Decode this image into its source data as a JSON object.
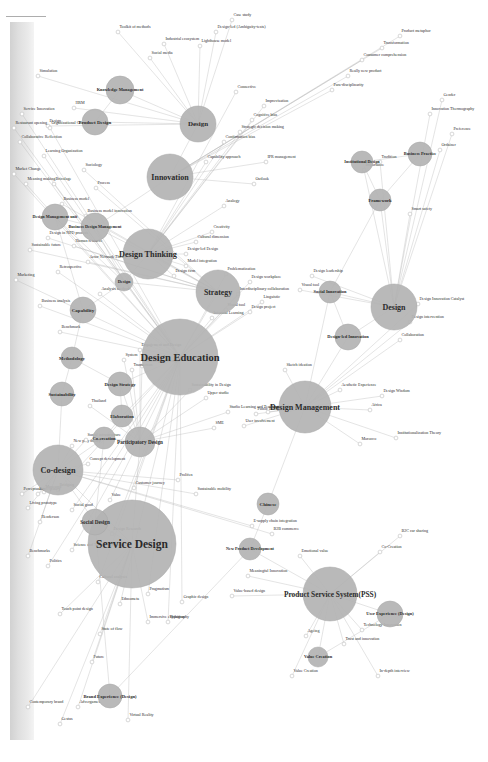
{
  "figure": {
    "kind": "node-link-network",
    "orientation_deg": -90,
    "background_color": "#ffffff",
    "node_fill": "#b3b3b3",
    "leaf_fill": "#ffffff",
    "edge_color": "#b9b9b9",
    "label_color": "#2b2b2b"
  },
  "chart_data": {
    "type": "network",
    "title": "",
    "hubs": [
      {
        "label": "Service Design",
        "x": 218,
        "y": 132,
        "r": 44,
        "fs": 11.5
      },
      {
        "label": "Design Education",
        "x": 405,
        "y": 180,
        "r": 38,
        "fs": 10.5
      },
      {
        "label": "Co-design",
        "x": 292,
        "y": 58,
        "r": 25,
        "fs": 8.2
      },
      {
        "label": "Design Management",
        "x": 355,
        "y": 305,
        "r": 26,
        "fs": 8.0
      },
      {
        "label": "Product Service System(PSS)",
        "x": 168,
        "y": 330,
        "r": 27,
        "fs": 7.4
      },
      {
        "label": "Design Thinking",
        "x": 508,
        "y": 148,
        "r": 25,
        "fs": 8.2
      },
      {
        "label": "Strategy",
        "x": 470,
        "y": 218,
        "r": 22,
        "fs": 7.8
      },
      {
        "label": "Innovation",
        "x": 585,
        "y": 170,
        "r": 23,
        "fs": 8.0
      },
      {
        "label": "Design",
        "x": 455,
        "y": 394,
        "r": 23,
        "fs": 8.0
      },
      {
        "label": "Design",
        "x": 638,
        "y": 198,
        "r": 18,
        "fs": 7.0
      },
      {
        "label": "Brand Experience (Design)",
        "x": 66,
        "y": 110,
        "r": 12,
        "fs": 4.6
      },
      {
        "label": "Social Design",
        "x": 240,
        "y": 95,
        "r": 13,
        "fs": 5.2
      },
      {
        "label": "New Product Development",
        "x": 213,
        "y": 250,
        "r": 11,
        "fs": 4.2
      },
      {
        "label": "Participatory Design",
        "x": 320,
        "y": 140,
        "r": 15,
        "fs": 5.2
      },
      {
        "label": "Chinese",
        "x": 258,
        "y": 268,
        "r": 11,
        "fs": 5.0
      },
      {
        "label": "User Experience (Design)",
        "x": 148,
        "y": 390,
        "r": 13,
        "fs": 4.4
      },
      {
        "label": "Value Creation",
        "x": 105,
        "y": 318,
        "r": 10,
        "fs": 4.4
      },
      {
        "label": "Design-led Innovation",
        "x": 425,
        "y": 348,
        "r": 13,
        "fs": 4.4
      },
      {
        "label": "Social Innovation",
        "x": 470,
        "y": 330,
        "r": 11,
        "fs": 4.4
      },
      {
        "label": "Product Design",
        "x": 640,
        "y": 95,
        "r": 13,
        "fs": 5.0
      },
      {
        "label": "Knowledge Management",
        "x": 672,
        "y": 120,
        "r": 14,
        "fs": 4.4
      },
      {
        "label": "Business Design Management",
        "x": 535,
        "y": 95,
        "r": 14,
        "fs": 4.2
      },
      {
        "label": "Design Management unit",
        "x": 545,
        "y": 55,
        "r": 13,
        "fs": 4.2
      },
      {
        "label": "Co-creation",
        "x": 324,
        "y": 104,
        "r": 11,
        "fs": 4.6
      },
      {
        "label": "Elaboration",
        "x": 346,
        "y": 122,
        "r": 11,
        "fs": 4.6
      },
      {
        "label": "Design Strategy",
        "x": 378,
        "y": 120,
        "r": 12,
        "fs": 4.6
      },
      {
        "label": "Capability",
        "x": 452,
        "y": 83,
        "r": 13,
        "fs": 5.0
      },
      {
        "label": "Methodology",
        "x": 404,
        "y": 72,
        "r": 11,
        "fs": 4.6
      },
      {
        "label": "Sustainability",
        "x": 368,
        "y": 62,
        "r": 12,
        "fs": 4.6
      },
      {
        "label": "Design",
        "x": 480,
        "y": 124,
        "r": 9,
        "fs": 4.4
      },
      {
        "label": "Framework",
        "x": 562,
        "y": 380,
        "r": 11,
        "fs": 4.6
      },
      {
        "label": "Institutional Design",
        "x": 600,
        "y": 362,
        "r": 11,
        "fs": 4.2
      },
      {
        "label": "Business Practice",
        "x": 608,
        "y": 420,
        "r": 12,
        "fs": 4.4
      }
    ],
    "leaves": [
      {
        "label": "Contemporary brand",
        "x": 55,
        "y": 28,
        "from": 0
      },
      {
        "label": "Gestus",
        "x": 38,
        "y": 60,
        "from": 0
      },
      {
        "label": "Advergames",
        "x": 55,
        "y": 78,
        "from": 0
      },
      {
        "label": "Future",
        "x": 100,
        "y": 92,
        "from": 0
      },
      {
        "label": "State of flow",
        "x": 128,
        "y": 100,
        "from": 0
      },
      {
        "label": "Virtual Reality",
        "x": 42,
        "y": 128,
        "from": 0
      },
      {
        "label": "Immersive exhibition",
        "x": 140,
        "y": 148,
        "from": 0
      },
      {
        "label": "Touch point design",
        "x": 148,
        "y": 60,
        "from": 0
      },
      {
        "label": "Politics",
        "x": 196,
        "y": 48,
        "from": 1
      },
      {
        "label": "Science and Technology Studies",
        "x": 212,
        "y": 72,
        "from": 1
      },
      {
        "label": "Cultural analysis",
        "x": 180,
        "y": 98,
        "from": 1
      },
      {
        "label": "Ethnometa",
        "x": 158,
        "y": 120,
        "from": 1
      },
      {
        "label": "Pragmatism",
        "x": 168,
        "y": 148,
        "from": 1
      },
      {
        "label": "Typography",
        "x": 140,
        "y": 168,
        "from": 1
      },
      {
        "label": "Graphic design",
        "x": 160,
        "y": 182,
        "from": 1
      },
      {
        "label": "Design Research",
        "x": 228,
        "y": 112,
        "from": 1
      },
      {
        "label": "Value",
        "x": 262,
        "y": 110,
        "from": 1
      },
      {
        "label": "Customer journey",
        "x": 274,
        "y": 134,
        "from": 1
      },
      {
        "label": "Social good",
        "x": 252,
        "y": 72,
        "from": 1
      },
      {
        "label": "Bridging",
        "x": 272,
        "y": 58,
        "from": 1
      },
      {
        "label": "Henderson",
        "x": 240,
        "y": 40,
        "from": 2
      },
      {
        "label": "Living prototype",
        "x": 254,
        "y": 28,
        "from": 2
      },
      {
        "label": "Participatory",
        "x": 268,
        "y": 38,
        "from": 2
      },
      {
        "label": "E-supply chain integration",
        "x": 236,
        "y": 252,
        "from": 2
      },
      {
        "label": "B2B commerce",
        "x": 228,
        "y": 272,
        "from": 2
      },
      {
        "label": "Museums",
        "x": 270,
        "y": 44,
        "from": 2
      },
      {
        "label": "Concept development",
        "x": 298,
        "y": 88,
        "from": 2
      },
      {
        "label": "New play theory",
        "x": 316,
        "y": 72,
        "from": 2
      },
      {
        "label": "Social infrastructure",
        "x": 322,
        "y": 86,
        "from": 2
      },
      {
        "label": "Sustainable mobility",
        "x": 268,
        "y": 196,
        "from": 2
      },
      {
        "label": "Prolifen",
        "x": 282,
        "y": 178,
        "from": 2
      },
      {
        "label": "Value Creation",
        "x": 86,
        "y": 292,
        "from": 4
      },
      {
        "label": "Ageing",
        "x": 126,
        "y": 306,
        "from": 4
      },
      {
        "label": "Trust and innovation",
        "x": 118,
        "y": 344,
        "from": 4
      },
      {
        "label": "Technology Innovation",
        "x": 132,
        "y": 362,
        "from": 4
      },
      {
        "label": "In-depth interview",
        "x": 86,
        "y": 378,
        "from": 4
      },
      {
        "label": "Co-Creation",
        "x": 210,
        "y": 380,
        "from": 4
      },
      {
        "label": "B2C car sharing",
        "x": 226,
        "y": 400,
        "from": 4
      },
      {
        "label": "Emotional value",
        "x": 206,
        "y": 300,
        "from": 4
      },
      {
        "label": "Value-based design",
        "x": 166,
        "y": 232,
        "from": 4
      },
      {
        "label": "Meaningful Innovation",
        "x": 186,
        "y": 248,
        "from": 4
      },
      {
        "label": "Morocco",
        "x": 318,
        "y": 360,
        "from": 3
      },
      {
        "label": "Institutionalization Theory",
        "x": 324,
        "y": 396,
        "from": 3
      },
      {
        "label": "Aesthetic Experience",
        "x": 372,
        "y": 340,
        "from": 3
      },
      {
        "label": "Africa",
        "x": 352,
        "y": 370,
        "from": 3
      },
      {
        "label": "Design Wisdom",
        "x": 366,
        "y": 382,
        "from": 3
      },
      {
        "label": "Sketch ideation",
        "x": 392,
        "y": 285,
        "from": 3
      },
      {
        "label": "Curated practice",
        "x": 350,
        "y": 268,
        "from": 3
      },
      {
        "label": "User involvement",
        "x": 336,
        "y": 244,
        "from": 3
      },
      {
        "label": "Public Policy",
        "x": 348,
        "y": 256,
        "from": 3
      },
      {
        "label": "Collaboration",
        "x": 422,
        "y": 400,
        "from": 3
      },
      {
        "label": "Design intervention",
        "x": 440,
        "y": 410,
        "from": 3
      },
      {
        "label": "Design Innovation Catalyst",
        "x": 458,
        "y": 418,
        "from": 3
      },
      {
        "label": "SME",
        "x": 334,
        "y": 214,
        "from": 13
      },
      {
        "label": "Studio Learning and Teaching",
        "x": 350,
        "y": 228,
        "from": 13
      },
      {
        "label": "Upper studio",
        "x": 364,
        "y": 206,
        "from": 13
      },
      {
        "label": "Sustainability in Design",
        "x": 372,
        "y": 190,
        "from": 13
      },
      {
        "label": "Workshop for Design",
        "x": 396,
        "y": 142,
        "from": 13
      },
      {
        "label": "Transaction",
        "x": 392,
        "y": 132,
        "from": 13
      },
      {
        "label": "System",
        "x": 402,
        "y": 124,
        "from": 13
      },
      {
        "label": "Engagement and Design",
        "x": 412,
        "y": 140,
        "from": 13
      },
      {
        "label": "Thailand",
        "x": 356,
        "y": 90,
        "from": 13
      },
      {
        "label": "Informal Learning",
        "x": 444,
        "y": 212,
        "from": 1
      },
      {
        "label": "Design project",
        "x": 450,
        "y": 250,
        "from": 1
      },
      {
        "label": "Linguistic",
        "x": 460,
        "y": 262,
        "from": 1
      },
      {
        "label": "Visual tool",
        "x": 452,
        "y": 226,
        "from": 1
      },
      {
        "label": "Interdisciplinary collaboration",
        "x": 468,
        "y": 238,
        "from": 1
      },
      {
        "label": "Design workplace",
        "x": 480,
        "y": 250,
        "from": 1
      },
      {
        "label": "Problematization",
        "x": 488,
        "y": 226,
        "from": 1
      },
      {
        "label": "Design firm",
        "x": 486,
        "y": 174,
        "from": 5
      },
      {
        "label": "Model integration",
        "x": 496,
        "y": 186,
        "from": 5
      },
      {
        "label": "Creativity",
        "x": 530,
        "y": 212,
        "from": 5
      },
      {
        "label": "Analogy",
        "x": 556,
        "y": 224,
        "from": 5
      },
      {
        "label": "Cultural dimension",
        "x": 520,
        "y": 196,
        "from": 5
      },
      {
        "label": "Design-led Design",
        "x": 508,
        "y": 186,
        "from": 5
      },
      {
        "label": "Capability approach",
        "x": 600,
        "y": 206,
        "from": 5
      },
      {
        "label": "Confirmation bias",
        "x": 620,
        "y": 224,
        "from": 5
      },
      {
        "label": "Strategic decision making",
        "x": 630,
        "y": 240,
        "from": 5
      },
      {
        "label": "Cognitive bias",
        "x": 642,
        "y": 252,
        "from": 5
      },
      {
        "label": "Improvisation",
        "x": 656,
        "y": 264,
        "from": 5
      },
      {
        "label": "Connective",
        "x": 670,
        "y": 236,
        "from": 5
      },
      {
        "label": "Actor Network Theory",
        "x": 500,
        "y": 88,
        "from": 6
      },
      {
        "label": "Human resource",
        "x": 516,
        "y": 74,
        "from": 6
      },
      {
        "label": "Business model innovation",
        "x": 546,
        "y": 86,
        "from": 6
      },
      {
        "label": "Process",
        "x": 574,
        "y": 96,
        "from": 6
      },
      {
        "label": "Sociology",
        "x": 592,
        "y": 84,
        "from": 6
      },
      {
        "label": "Design in NPD process",
        "x": 524,
        "y": 48,
        "from": 6
      },
      {
        "label": "Sustainable future",
        "x": 512,
        "y": 30,
        "from": 6
      },
      {
        "label": "Business model",
        "x": 558,
        "y": 62,
        "from": 6
      },
      {
        "label": "Para-disciplinarity",
        "x": 672,
        "y": 332,
        "from": 7
      },
      {
        "label": "Really new product",
        "x": 686,
        "y": 348,
        "from": 7
      },
      {
        "label": "Consumer comprehension",
        "x": 702,
        "y": 362,
        "from": 7
      },
      {
        "label": "Transformation",
        "x": 714,
        "y": 382,
        "from": 7
      },
      {
        "label": "Product metaphor",
        "x": 726,
        "y": 400,
        "from": 7
      },
      {
        "label": "IPR management",
        "x": 600,
        "y": 266,
        "from": 7
      },
      {
        "label": "Outlook",
        "x": 578,
        "y": 254,
        "from": 7
      },
      {
        "label": "Ordainer",
        "x": 612,
        "y": 440,
        "from": 8
      },
      {
        "label": "Preference",
        "x": 628,
        "y": 452,
        "from": 8
      },
      {
        "label": "Innovation Thermography",
        "x": 648,
        "y": 430,
        "from": 8
      },
      {
        "label": "Gender",
        "x": 662,
        "y": 442,
        "from": 8
      },
      {
        "label": "Smart safety",
        "x": 548,
        "y": 410,
        "from": 8
      },
      {
        "label": "Visual tool",
        "x": 472,
        "y": 300,
        "from": 8
      },
      {
        "label": "Design leadership",
        "x": 486,
        "y": 312,
        "from": 8
      },
      {
        "label": "Importance",
        "x": 592,
        "y": 364,
        "from": 8
      },
      {
        "label": "Tradition",
        "x": 600,
        "y": 380,
        "from": 8
      },
      {
        "label": "Simulation",
        "x": 686,
        "y": 38,
        "from": 9
      },
      {
        "label": "Social media",
        "x": 704,
        "y": 150,
        "from": 9
      },
      {
        "label": "Industrial ecosystem",
        "x": 718,
        "y": 164,
        "from": 9
      },
      {
        "label": "Toolkit of methods",
        "x": 730,
        "y": 118,
        "from": 9
      },
      {
        "label": "Lighthouse model",
        "x": 716,
        "y": 200,
        "from": 9
      },
      {
        "label": "Design-led (Ambiguity-tests)",
        "x": 730,
        "y": 216,
        "from": 9
      },
      {
        "label": "Case study",
        "x": 742,
        "y": 232,
        "from": 9
      },
      {
        "label": "HRM",
        "x": 654,
        "y": 74,
        "from": 9
      },
      {
        "label": "Design",
        "x": 636,
        "y": 48,
        "from": 9
      },
      {
        "label": "Marketing",
        "x": 482,
        "y": 16,
        "from": 1
      },
      {
        "label": "Meaning making",
        "x": 578,
        "y": 26,
        "from": 1
      },
      {
        "label": "Market Change",
        "x": 588,
        "y": 14,
        "from": 1
      },
      {
        "label": "Collaborative Reflection",
        "x": 620,
        "y": 20,
        "from": 1
      },
      {
        "label": "Restaurant opening",
        "x": 634,
        "y": 14,
        "from": 1
      },
      {
        "label": "Service Innovation",
        "x": 648,
        "y": 22,
        "from": 1
      },
      {
        "label": "Bricolage",
        "x": 578,
        "y": 54,
        "from": 1
      },
      {
        "label": "Learning Organization",
        "x": 606,
        "y": 44,
        "from": 1
      },
      {
        "label": "Organizational Change",
        "x": 634,
        "y": 50,
        "from": 1
      },
      {
        "label": "Retrospective",
        "x": 490,
        "y": 58,
        "from": 1
      },
      {
        "label": "Business analysis",
        "x": 456,
        "y": 40,
        "from": 1
      },
      {
        "label": "Benchmark",
        "x": 430,
        "y": 60,
        "from": 1
      },
      {
        "label": "Analysis method",
        "x": 468,
        "y": 100,
        "from": 1
      },
      {
        "label": "Benchmarks",
        "x": 206,
        "y": 28,
        "from": 2
      },
      {
        "label": "Perceptuality",
        "x": 268,
        "y": 22,
        "from": 2
      }
    ]
  }
}
